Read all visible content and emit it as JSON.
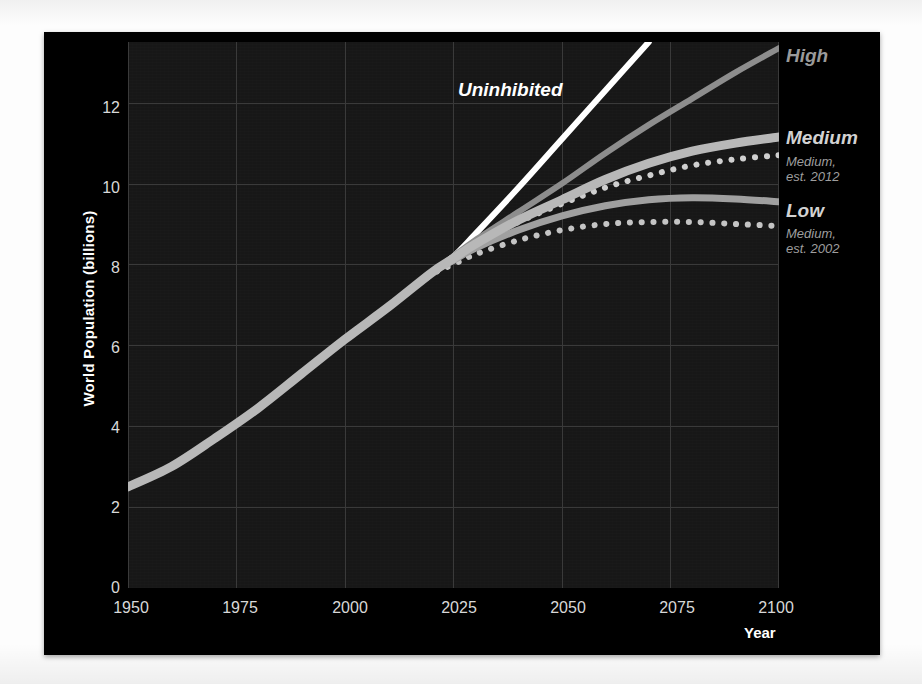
{
  "slide": {
    "background_color": "#000000",
    "plot_background_color": "#171717"
  },
  "chart_data": {
    "type": "line",
    "title": "",
    "xlabel": "Year",
    "ylabel": "World Population (billions)",
    "xlim": [
      1950,
      2100
    ],
    "ylim": [
      0,
      13.5
    ],
    "xticks": [
      "1950",
      "1975",
      "2000",
      "2025",
      "2050",
      "2075",
      "2100"
    ],
    "yticks": [
      "0",
      "2",
      "4",
      "6",
      "8",
      "10",
      "12"
    ],
    "grid": true,
    "legend_position": "inline-right",
    "x": [
      1950,
      1960,
      1970,
      1980,
      1990,
      2000,
      2010,
      2020,
      2025,
      2030,
      2040,
      2050,
      2060,
      2070,
      2080,
      2090,
      2100
    ],
    "series": [
      {
        "name": "Uninhibited",
        "label": "Uninhibited",
        "color": "#ffffff",
        "style": "solid",
        "width": 6,
        "values": [
          2.5,
          3.0,
          3.7,
          4.45,
          5.3,
          6.15,
          6.95,
          7.8,
          8.2,
          8.75,
          9.9,
          11.1,
          12.3,
          13.5,
          null,
          null,
          null
        ]
      },
      {
        "name": "High",
        "label": "High",
        "color": "#8d8d8d",
        "style": "solid",
        "width": 6,
        "values": [
          2.5,
          3.0,
          3.7,
          4.45,
          5.3,
          6.15,
          6.95,
          7.8,
          8.2,
          8.6,
          9.3,
          10.0,
          10.75,
          11.45,
          12.1,
          12.75,
          13.35
        ]
      },
      {
        "name": "Medium",
        "label": "Medium",
        "color": "#b8b8b8",
        "style": "solid",
        "width": 9,
        "values": [
          2.5,
          3.0,
          3.7,
          4.45,
          5.3,
          6.15,
          6.95,
          7.8,
          8.15,
          8.5,
          9.1,
          9.6,
          10.1,
          10.5,
          10.8,
          11.0,
          11.15
        ]
      },
      {
        "name": "Medium, est. 2012",
        "label": "Medium,\nest. 2012",
        "label_line1": "Medium,",
        "label_line2": "est. 2012",
        "color": "#cfcfcf",
        "style": "dotted",
        "width": 6,
        "values": [
          2.5,
          3.0,
          3.7,
          4.45,
          5.3,
          6.15,
          6.95,
          7.8,
          8.15,
          8.5,
          9.05,
          9.5,
          9.9,
          10.2,
          10.45,
          10.6,
          10.7
        ]
      },
      {
        "name": "Low",
        "label": "Low",
        "color": "#a0a0a0",
        "style": "solid",
        "width": 7,
        "values": [
          2.5,
          3.0,
          3.7,
          4.45,
          5.3,
          6.15,
          6.95,
          7.8,
          8.1,
          8.4,
          8.85,
          9.2,
          9.45,
          9.6,
          9.65,
          9.62,
          9.55
        ]
      },
      {
        "name": "Medium, est. 2002",
        "label": "Medium,\nest. 2002",
        "label_line1": "Medium,",
        "label_line2": "est. 2002",
        "color": "#c4c4c4",
        "style": "dotted",
        "width": 6,
        "values": [
          2.5,
          3.0,
          3.7,
          4.45,
          5.3,
          6.15,
          6.95,
          7.75,
          8.0,
          8.25,
          8.6,
          8.85,
          9.0,
          9.05,
          9.05,
          9.0,
          8.95
        ]
      }
    ],
    "annotations": [
      {
        "text": "Uninhibited",
        "x": 2022,
        "y": 12.55,
        "color": "#ffffff"
      },
      {
        "text": "High",
        "x": 2101,
        "y": 13.1,
        "color": "#9a9a9a"
      },
      {
        "text": "Medium",
        "x": 2101,
        "y": 11.4,
        "color": "#d0d0d0"
      },
      {
        "text": "Medium, est. 2012",
        "x": 2101,
        "y": 10.55,
        "color": "#9e9e9e"
      },
      {
        "text": "Low",
        "x": 2101,
        "y": 9.7,
        "color": "#d0d0d0"
      },
      {
        "text": "Medium, est. 2002",
        "x": 2101,
        "y": 8.95,
        "color": "#9e9e9e"
      }
    ]
  }
}
